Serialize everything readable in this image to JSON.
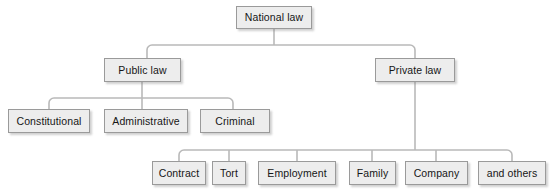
{
  "diagram": {
    "type": "hierarchy-tree",
    "orientation": "top-down",
    "style": {
      "node_fill": "#ededed",
      "node_border": "#9a9a9a",
      "connector_color": "#b9b9b9",
      "text_color": "#161616",
      "background": "#ffffff"
    },
    "levels": [
      {
        "level": 1,
        "nodes": [
          {
            "id": "national-law",
            "label": "National law",
            "x": 236,
            "y": 6,
            "w": 76,
            "h": 23
          }
        ]
      },
      {
        "level": 2,
        "nodes": [
          {
            "id": "public-law",
            "label": "Public law",
            "x": 104,
            "y": 58,
            "w": 77,
            "h": 24
          },
          {
            "id": "private-law",
            "label": "Private law",
            "x": 375,
            "y": 58,
            "w": 80,
            "h": 24
          }
        ]
      },
      {
        "level": 3,
        "nodes": [
          {
            "id": "constitutional",
            "label": "Constitutional",
            "x": 8,
            "y": 109,
            "w": 82,
            "h": 24
          },
          {
            "id": "administrative",
            "label": "Administrative",
            "x": 104,
            "y": 109,
            "w": 84,
            "h": 24
          },
          {
            "id": "criminal",
            "label": "Criminal",
            "x": 200,
            "y": 109,
            "w": 70,
            "h": 24
          },
          {
            "id": "contract",
            "label": "Contract",
            "x": 152,
            "y": 161,
            "w": 54,
            "h": 24
          },
          {
            "id": "tort",
            "label": "Tort",
            "x": 212,
            "y": 161,
            "w": 34,
            "h": 24
          },
          {
            "id": "employment",
            "label": "Employment",
            "x": 258,
            "y": 161,
            "w": 78,
            "h": 24
          },
          {
            "id": "family",
            "label": "Family",
            "x": 349,
            "y": 161,
            "w": 47,
            "h": 24
          },
          {
            "id": "company",
            "label": "Company",
            "x": 405,
            "y": 161,
            "w": 63,
            "h": 24
          },
          {
            "id": "and-others",
            "label": "and others",
            "x": 478,
            "y": 161,
            "w": 68,
            "h": 24
          }
        ]
      }
    ],
    "edges": [
      {
        "from": "national-law",
        "to": "public-law"
      },
      {
        "from": "national-law",
        "to": "private-law"
      },
      {
        "from": "public-law",
        "to": "constitutional"
      },
      {
        "from": "public-law",
        "to": "administrative"
      },
      {
        "from": "public-law",
        "to": "criminal"
      },
      {
        "from": "private-law",
        "to": "contract"
      },
      {
        "from": "private-law",
        "to": "tort"
      },
      {
        "from": "private-law",
        "to": "employment"
      },
      {
        "from": "private-law",
        "to": "family"
      },
      {
        "from": "private-law",
        "to": "company"
      },
      {
        "from": "private-law",
        "to": "and-others"
      }
    ]
  }
}
